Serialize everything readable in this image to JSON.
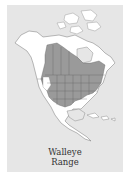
{
  "map": {
    "title_line1": "Walleye",
    "title_line2": "Range",
    "region": "North America",
    "legend": [
      {
        "label": "Walleye range",
        "color": "#9a9a9a"
      },
      {
        "label": "Land outside range",
        "color": "#ffffff"
      },
      {
        "label": "Water / background",
        "color": "#e6e6e6"
      }
    ]
  }
}
